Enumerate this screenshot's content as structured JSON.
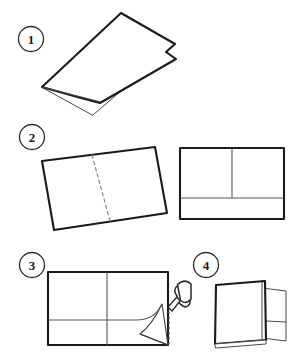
{
  "diagram": {
    "background_color": "#ffffff",
    "ink_color": "#1a1a1a",
    "fold_line_color": "#5a5a5a",
    "crease_color": "#8a8a8a",
    "total_steps": 4
  },
  "steps": [
    {
      "number": "1",
      "badge_label": "1",
      "caption": "",
      "illustration": "folded-sheet-perspective",
      "description": "A sheet of paper folded in half, shown in perspective from above with the open edge toward the lower left"
    },
    {
      "number": "2",
      "badge_label": "2",
      "caption": "",
      "illustration": "unfolded-sheet-with-crease-and-flat-folder",
      "description": "Tilted unfolded sheet showing a dashed vertical center crease, beside a flat rectangle marked with a center divider and a horizontal pocket fold line"
    },
    {
      "number": "3",
      "badge_label": "3",
      "caption": "",
      "illustration": "glue-applied-to-pocket-flap",
      "description": "Rectangle with center divider and horizontal pocket fold; a glue bottle applies glue to the lifted corner flap at the right edge"
    },
    {
      "number": "4",
      "badge_label": "4",
      "caption": "",
      "illustration": "finished-standing-folder",
      "description": "The finished folder standing upright with its pocket visible at the right side"
    }
  ],
  "tools": [
    {
      "name": "glue-bottle",
      "label": "glue bottle",
      "shown_in_step": "3"
    }
  ]
}
